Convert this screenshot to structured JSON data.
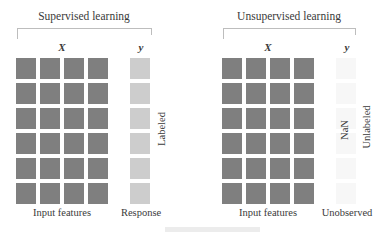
{
  "panels": {
    "supervised": {
      "title": "Supervised learning",
      "x_label": "X",
      "y_label": "y",
      "x_caption": "Input features",
      "y_caption": "Response",
      "side_label": "Labeled",
      "grid": {
        "rows": 6,
        "cols": 4,
        "tile_color": "#7f7f7f"
      },
      "y_column": {
        "rows": 6,
        "tile_color": "#cdcdcd"
      }
    },
    "unsupervised": {
      "title": "Unsupervised learning",
      "x_label": "X",
      "y_label": "y",
      "x_caption": "Input features",
      "y_caption": "Unobserved",
      "nan_label": "NaN",
      "side_label": "Unlabeled",
      "grid": {
        "rows": 6,
        "cols": 4,
        "tile_color": "#7f7f7f"
      },
      "y_column": {
        "rows": 6,
        "tile_color": "#f7f7f7"
      }
    }
  }
}
